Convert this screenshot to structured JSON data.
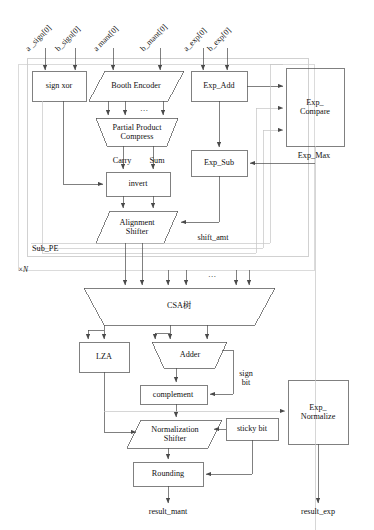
{
  "diagram": {
    "ink_color": "#3a3a3a",
    "text_color": "#111111"
  },
  "inputs": [
    {
      "name": "a_sign",
      "label": "a _sign[0]"
    },
    {
      "name": "b_sign",
      "label": "b_sign[0]"
    },
    {
      "name": "a_mant",
      "label": "a mant[0]"
    },
    {
      "name": "b_mant",
      "label": "b_mant[0]"
    },
    {
      "name": "a_exp",
      "label": "a_exp[0]"
    },
    {
      "name": "b_exp",
      "label": "b_exp[0]"
    }
  ],
  "blocks": {
    "sign_xor": "sign xor",
    "booth_encoder": "Booth Encoder",
    "partial_product_compress": "Partial Product\nCompress",
    "invert": "invert",
    "alignment_shifter": "Alignment\nShifter",
    "exp_add": "Exp_Add",
    "exp_sub": "Exp_Sub",
    "exp_compare": "Exp_\nCompare",
    "csa_tree": "CSA树",
    "lza": "LZA",
    "adder": "Adder",
    "complement": "complement",
    "normalization_shifter": "Normalization\nShifter",
    "sticky_bit": "sticky bit",
    "rounding": "Rounding",
    "exp_normalize": "Exp_\nNormalize"
  },
  "signals": {
    "carry": "Carry",
    "sum": "Sum",
    "shift_amt": "shift_amt",
    "exp_max": "Exp_Max",
    "sign_bit": "sign\nbit",
    "ellipsis": "…"
  },
  "groups": {
    "sub_pe": "Sub_PE",
    "replication": "×N"
  },
  "outputs": {
    "result_mant": "result_mant",
    "result_exp": "result_exp"
  }
}
